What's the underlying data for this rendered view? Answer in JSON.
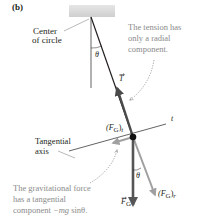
{
  "panel_label": "(b)",
  "labels": {
    "center_line1": "Center",
    "center_line2": "of circle",
    "theta_top": "θ",
    "tension_symbol": "T",
    "tension_note_line1": "The tension has",
    "tension_note_line2": "only a radial",
    "tension_note_line3": "component.",
    "tangential_axis_line1": "Tangential",
    "tangential_axis_line2": "axis",
    "t_axis": "t",
    "fg_t_main": "(F",
    "fg_t_sub": "G",
    "fg_t_close": ")",
    "fg_t_subscript": "t",
    "fg_r_main": "(F",
    "fg_r_sub": "G",
    "fg_r_close": ")",
    "fg_r_subscript": "r",
    "fg_symbol": "F",
    "fg_symbol_sub": "G",
    "theta_bottom": "θ",
    "gravity_note_line1": "The gravitational force",
    "gravity_note_line2": "has a tangential",
    "gravity_note_line3_pre": "component ",
    "gravity_note_line3_math": "−mg",
    "gravity_note_line3_post": " sinθ."
  },
  "colors": {
    "string": "#231f20",
    "tension_arrow": "#4a4a4a",
    "gravity_arrow": "#555555",
    "component_arrow": "#a0a0a0",
    "axis": "#231f20",
    "note_text": "#8a8a8a",
    "ceiling": "#d9d9d9"
  }
}
